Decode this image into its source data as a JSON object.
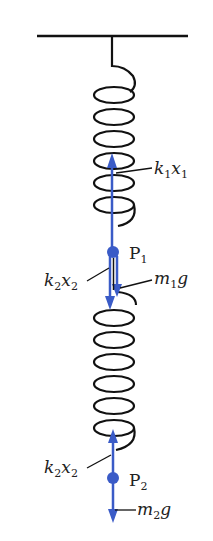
{
  "diagram": {
    "type": "spring-mass free-body diagram",
    "colors": {
      "spring": "#111111",
      "force_arrow": "#3a5bc7",
      "point": "#3a5bc7",
      "label": "#222222"
    },
    "labels": {
      "k1x1": {
        "main1": "k",
        "sub1": "1",
        "main2": "x",
        "sub2": "1"
      },
      "k2x2_upper": {
        "main1": "k",
        "sub1": "2",
        "main2": "x",
        "sub2": "2"
      },
      "m1g": {
        "main1": "m",
        "sub1": "1",
        "main2": "g"
      },
      "k2x2_lower": {
        "main1": "k",
        "sub1": "2",
        "main2": "x",
        "sub2": "2"
      },
      "m2g": {
        "main1": "m",
        "sub1": "2",
        "main2": "g"
      },
      "P1": {
        "main": "P",
        "sub": "1"
      },
      "P2": {
        "main": "P",
        "sub": "2"
      }
    }
  }
}
